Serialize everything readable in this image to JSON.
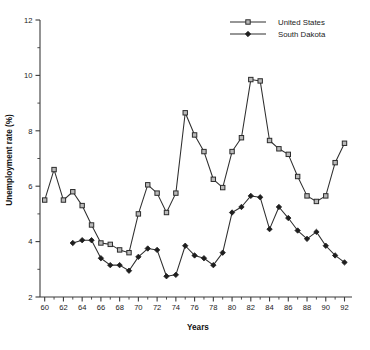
{
  "chart_data": {
    "type": "line",
    "title": "",
    "xlabel": "Years",
    "ylabel": "Unemployment rate (%)",
    "xlim": [
      59.5,
      92.8
    ],
    "ylim": [
      2,
      12
    ],
    "grid": false,
    "legend_position": "top-right",
    "y_ticks": [
      2,
      4,
      6,
      8,
      10,
      12
    ],
    "y_tick_labels": [
      "2",
      "4",
      "6",
      "8",
      "10",
      "12"
    ],
    "y_minor_ticks": [
      3,
      5,
      7,
      9,
      11
    ],
    "x_ticks": [
      60,
      61,
      62,
      63,
      64,
      65,
      66,
      67,
      68,
      69,
      70,
      71,
      72,
      73,
      74,
      75,
      76,
      77,
      78,
      79,
      80,
      81,
      82,
      83,
      84,
      85,
      86,
      87,
      88,
      89,
      90,
      91,
      92
    ],
    "x_tick_labels": [
      "60",
      "",
      "62",
      "",
      "64",
      "",
      "66",
      "",
      "68",
      "",
      "70",
      "",
      "72",
      "",
      "74",
      "",
      "76",
      "",
      "78",
      "",
      "80",
      "",
      "82",
      "",
      "84",
      "",
      "86",
      "",
      "88",
      "",
      "90",
      "",
      "92"
    ],
    "x_major_ticks": [
      60,
      62,
      64,
      66,
      68,
      70,
      72,
      74,
      76,
      78,
      80,
      82,
      84,
      86,
      88,
      90,
      92
    ],
    "series": [
      {
        "name": "United States",
        "marker": "open-square",
        "color": "#2e2e2e",
        "x": [
          60,
          61,
          62,
          63,
          64,
          65,
          66,
          67,
          68,
          69,
          70,
          71,
          72,
          73,
          74,
          75,
          76,
          77,
          78,
          79,
          80,
          81,
          82,
          83,
          84,
          85,
          86,
          87,
          88,
          89,
          90,
          91,
          92
        ],
        "values": [
          5.5,
          6.6,
          5.5,
          5.8,
          5.3,
          4.6,
          3.95,
          3.9,
          3.7,
          3.6,
          5.0,
          6.05,
          5.75,
          5.05,
          5.75,
          8.65,
          7.85,
          7.25,
          6.25,
          5.95,
          7.25,
          7.75,
          9.85,
          9.8,
          7.65,
          7.35,
          7.15,
          6.35,
          5.65,
          5.45,
          5.65,
          6.85,
          7.55
        ]
      },
      {
        "name": "South Dakota",
        "marker": "filled-diamond",
        "color": "#1e1e1e",
        "x": [
          63,
          64,
          65,
          66,
          67,
          68,
          69,
          70,
          71,
          72,
          73,
          74,
          75,
          76,
          77,
          78,
          79,
          80,
          81,
          82,
          83,
          84,
          85,
          86,
          87,
          88,
          89,
          90,
          91,
          92
        ],
        "values": [
          3.95,
          4.05,
          4.05,
          3.4,
          3.15,
          3.15,
          2.95,
          3.45,
          3.75,
          3.7,
          2.75,
          2.8,
          3.85,
          3.5,
          3.4,
          3.15,
          3.6,
          5.05,
          5.25,
          5.65,
          5.6,
          4.45,
          5.25,
          4.85,
          4.4,
          4.1,
          4.35,
          3.85,
          3.5,
          3.25
        ]
      }
    ]
  },
  "legend": {
    "entries": [
      {
        "label": "United States"
      },
      {
        "label": "South Dakota"
      }
    ]
  },
  "axes": {
    "x_title": "Years",
    "y_title": "Unemployment rate (%)"
  }
}
